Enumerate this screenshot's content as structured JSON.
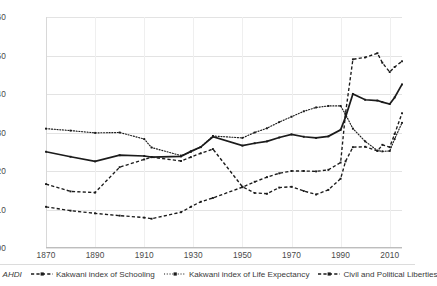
{
  "chart_data": {
    "type": "line",
    "title": "",
    "xlabel": "",
    "ylabel": "",
    "xlim": [
      1870,
      2015
    ],
    "ylim": [
      0.0,
      0.6
    ],
    "grid": true,
    "legend_position": "bottom",
    "y_ticks": [
      "0.00",
      "0.10",
      "0.20",
      "0.30",
      "0.40",
      "0.50",
      "0.60"
    ],
    "y_tick_values": [
      0.0,
      0.1,
      0.2,
      0.3,
      0.4,
      0.5,
      0.6
    ],
    "x_ticks": [
      "1870",
      "1890",
      "1910",
      "1930",
      "1950",
      "1970",
      "1990",
      "2010"
    ],
    "x_tick_values": [
      1870,
      1890,
      1910,
      1930,
      1950,
      1970,
      1990,
      2010
    ],
    "x": [
      1870,
      1880,
      1890,
      1900,
      1910,
      1913,
      1925,
      1929,
      1933,
      1938,
      1950,
      1955,
      1960,
      1965,
      1970,
      1975,
      1980,
      1985,
      1990,
      1992,
      1995,
      2000,
      2005,
      2007,
      2010,
      2012,
      2015
    ],
    "series": [
      {
        "name": "AHDI",
        "style": "solid",
        "color": "#1b1b1b",
        "values": [
          0.25,
          0.237,
          0.225,
          0.241,
          0.239,
          0.236,
          0.238,
          0.251,
          0.262,
          0.289,
          0.266,
          0.272,
          0.277,
          0.287,
          0.295,
          0.289,
          0.286,
          0.29,
          0.307,
          0.34,
          0.4,
          0.385,
          0.383,
          0.379,
          0.374,
          0.391,
          0.425
        ]
      },
      {
        "name": "Kakwani index of Schooling",
        "style": "dashed",
        "color": "#1b1b1b",
        "values": [
          0.166,
          0.147,
          0.144,
          0.21,
          0.23,
          0.236,
          0.226,
          0.236,
          0.246,
          0.257,
          0.159,
          0.143,
          0.141,
          0.157,
          0.159,
          0.148,
          0.139,
          0.151,
          0.18,
          0.225,
          0.262,
          0.263,
          0.252,
          0.268,
          0.262,
          0.296,
          0.35
        ]
      },
      {
        "name": "Kakwani index of Life Expectancy",
        "style": "dotted",
        "color": "#1b1b1b",
        "values": [
          0.31,
          0.305,
          0.299,
          0.3,
          0.283,
          0.261,
          0.24,
          0.25,
          0.262,
          0.291,
          0.286,
          0.3,
          0.311,
          0.327,
          0.341,
          0.355,
          0.365,
          0.369,
          0.369,
          0.347,
          0.31,
          0.277,
          0.253,
          0.251,
          0.252,
          0.283,
          0.325
        ]
      },
      {
        "name": "Civil and Political Liberties",
        "style": "dash-dot",
        "color": "#1b1b1b",
        "values": [
          0.107,
          0.097,
          0.09,
          0.084,
          0.079,
          0.076,
          0.093,
          0.107,
          0.12,
          0.13,
          0.158,
          0.172,
          0.184,
          0.194,
          0.2,
          0.2,
          0.199,
          0.203,
          0.222,
          0.35,
          0.49,
          0.495,
          0.506,
          0.481,
          0.457,
          0.47,
          0.485
        ]
      }
    ]
  },
  "legend": {
    "items": [
      {
        "label": "AHDI",
        "name": "legend-item-ahdi",
        "italic": true
      },
      {
        "label": "Kakwani index of Schooling",
        "name": "legend-item-schooling",
        "italic": false
      },
      {
        "label": "Kakwani index of Life Expectancy",
        "name": "legend-item-life-expectancy",
        "italic": false
      },
      {
        "label": "Civil and Political Liberties",
        "name": "legend-item-civil-liberties",
        "italic": false
      }
    ]
  }
}
